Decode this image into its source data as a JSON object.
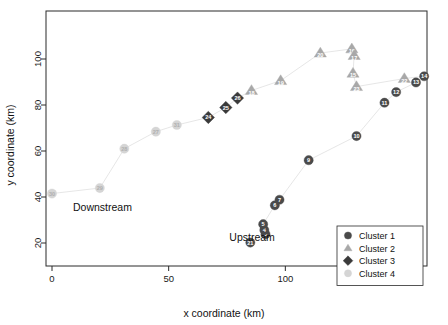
{
  "figure": {
    "background": "#ffffff",
    "frame_color": "#2b2b2b"
  },
  "annotations": [
    {
      "name": "downstream-label",
      "text": "Downstream",
      "x": 9,
      "y": 34
    },
    {
      "name": "upstream-label",
      "text": "Upstream",
      "x": 76,
      "y": 21
    }
  ],
  "legend": {
    "position": "bottom-right",
    "items": [
      {
        "label": "Cluster 1",
        "marker": "circle",
        "color": "#4a4a4a"
      },
      {
        "label": "Cluster 2",
        "marker": "triangle",
        "color": "#a8a8a8"
      },
      {
        "label": "Cluster 3",
        "marker": "diamond",
        "color": "#3a3a3a"
      },
      {
        "label": "Cluster 4",
        "marker": "circle",
        "color": "#d5d5d5"
      }
    ]
  },
  "chart_data": {
    "type": "scatter",
    "title": "",
    "xlabel": "x coordinate (km)",
    "ylabel": "y coordinate (km)",
    "xlim": [
      -9,
      168
    ],
    "ylim": [
      12,
      117
    ],
    "xticks": [
      0,
      50,
      100,
      150
    ],
    "yticks": [
      20,
      40,
      60,
      80,
      100
    ],
    "grid": false,
    "connect_points": true,
    "series": [
      {
        "name": "Cluster 1",
        "marker": "circle",
        "color": "#4a4a4a",
        "label_color": "#ffffff",
        "points": [
          {
            "label": "21",
            "x": 85.0,
            "y": 20.2
          },
          {
            "label": "3",
            "x": 91.5,
            "y": 23.8
          },
          {
            "label": "4",
            "x": 91.0,
            "y": 25.6
          },
          {
            "label": "5",
            "x": 90.5,
            "y": 28.2
          },
          {
            "label": "6",
            "x": 95.5,
            "y": 36.4
          },
          {
            "label": "7",
            "x": 97.5,
            "y": 38.8
          },
          {
            "label": "9",
            "x": 110.0,
            "y": 56.0
          },
          {
            "label": "10",
            "x": 130.5,
            "y": 66.5
          },
          {
            "label": "11",
            "x": 142.5,
            "y": 81.0
          },
          {
            "label": "12",
            "x": 147.5,
            "y": 85.6
          },
          {
            "label": "13",
            "x": 156.0,
            "y": 89.8
          },
          {
            "label": "14",
            "x": 159.5,
            "y": 92.5
          }
        ]
      },
      {
        "name": "Cluster 2",
        "marker": "triangle",
        "color": "#a8a8a8",
        "label_color": "#ffffff",
        "points": [
          {
            "label": "18",
            "x": 85.5,
            "y": 86.3
          },
          {
            "label": "19",
            "x": 98.0,
            "y": 90.6
          },
          {
            "label": "20",
            "x": 115.0,
            "y": 102.6
          },
          {
            "label": "16",
            "x": 128.5,
            "y": 104.4
          },
          {
            "label": "17",
            "x": 129.5,
            "y": 101.5
          },
          {
            "label": "15",
            "x": 129.0,
            "y": 93.8
          },
          {
            "label": "23",
            "x": 130.5,
            "y": 88.0
          },
          {
            "label": "22",
            "x": 151.0,
            "y": 91.5
          }
        ]
      },
      {
        "name": "Cluster 3",
        "marker": "diamond",
        "color": "#3a3a3a",
        "label_color": "#ffffff",
        "points": [
          {
            "label": "24",
            "x": 67.0,
            "y": 74.6
          },
          {
            "label": "25",
            "x": 74.5,
            "y": 78.9
          },
          {
            "label": "26",
            "x": 79.5,
            "y": 83.0
          }
        ]
      },
      {
        "name": "Cluster 4",
        "marker": "circle",
        "color": "#d5d5d5",
        "label_color": "#b0b0b0",
        "points": [
          {
            "label": "30",
            "x": 0.0,
            "y": 41.5
          },
          {
            "label": "29",
            "x": 20.5,
            "y": 43.9
          },
          {
            "label": "28",
            "x": 31.0,
            "y": 61.0
          },
          {
            "label": "27",
            "x": 44.5,
            "y": 68.4
          },
          {
            "label": "31",
            "x": 53.5,
            "y": 71.3
          }
        ]
      }
    ],
    "connector_color": "#e0e0e0"
  }
}
